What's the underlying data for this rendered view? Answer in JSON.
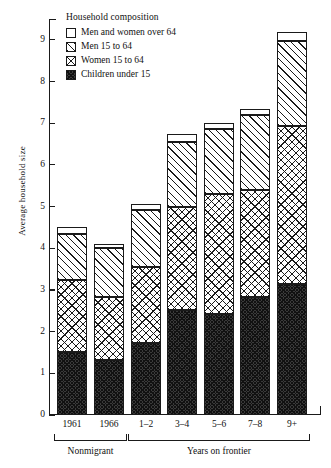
{
  "chart_data": {
    "type": "bar",
    "subtype": "stacked",
    "title": "",
    "xlabel": "",
    "ylabel": "Average household size",
    "ylim": [
      0,
      9.5
    ],
    "yticks": [
      0,
      1,
      2,
      3,
      4,
      5,
      6,
      7,
      8,
      9
    ],
    "grid": false,
    "legend_position": "top-left",
    "legend_title": "Household composition",
    "categories": [
      "1961",
      "1966",
      "1–2",
      "3–4",
      "5–6",
      "7–8",
      "9+"
    ],
    "groups": [
      {
        "label": "Nonmigrant",
        "categories": [
          "1961",
          "1966"
        ]
      },
      {
        "label": "Years on frontier",
        "categories": [
          "1–2",
          "3–4",
          "5–6",
          "7–8",
          "9+"
        ]
      }
    ],
    "series": [
      {
        "name": "Children under 15",
        "key": "children",
        "fill": "solid-dark",
        "values": [
          1.52,
          1.33,
          1.73,
          2.53,
          2.43,
          2.82,
          3.15
        ]
      },
      {
        "name": "Women 15 to 64",
        "key": "women",
        "fill": "crosshatch",
        "values": [
          1.71,
          1.5,
          1.83,
          2.47,
          2.87,
          2.58,
          3.78
        ]
      },
      {
        "name": "Men 15 to 64",
        "key": "men",
        "fill": "hatch",
        "values": [
          1.12,
          1.17,
          1.36,
          1.56,
          1.57,
          1.8,
          2.05
        ]
      },
      {
        "name": "Men and women over 64",
        "key": "over64",
        "fill": "white",
        "values": [
          0.15,
          0.1,
          0.15,
          0.17,
          0.13,
          0.15,
          0.22
        ]
      }
    ],
    "cumulative_tops": {
      "children": [
        1.52,
        1.33,
        1.73,
        2.53,
        2.43,
        2.82,
        3.15
      ],
      "women": [
        3.23,
        2.83,
        3.56,
        5.0,
        5.3,
        5.4,
        6.93
      ],
      "men": [
        4.35,
        4.0,
        4.92,
        6.56,
        6.87,
        7.2,
        8.98
      ],
      "over64": [
        4.5,
        4.1,
        5.07,
        6.73,
        7.0,
        7.35,
        9.2
      ]
    },
    "totals": [
      4.5,
      4.1,
      5.07,
      6.73,
      7.0,
      7.35,
      9.2
    ]
  },
  "legend": {
    "title": "Household composition",
    "items": [
      {
        "label": "Men and women over 64",
        "swatch": "white-square-swatch"
      },
      {
        "label": "Men 15 to 64",
        "swatch": "hatched-square-swatch"
      },
      {
        "label": "Women 15 to 64",
        "swatch": "crosshatched-square-swatch"
      },
      {
        "label": "Children under 15",
        "swatch": "solid-dark-square-swatch"
      }
    ]
  },
  "axes": {
    "y": {
      "label": "Average household size",
      "ticks": [
        "0",
        "1",
        "2",
        "3",
        "4",
        "5",
        "6",
        "7",
        "8",
        "9"
      ]
    },
    "x": {
      "ticks": [
        "1961",
        "1966",
        "1–2",
        "3–4",
        "5–6",
        "7–8",
        "9+"
      ],
      "groups": [
        "Nonmigrant",
        "Years on frontier"
      ]
    }
  },
  "colors": {
    "ink": "#1a1a1a",
    "background": "#ffffff",
    "children_fill": "#3a3a3a"
  }
}
